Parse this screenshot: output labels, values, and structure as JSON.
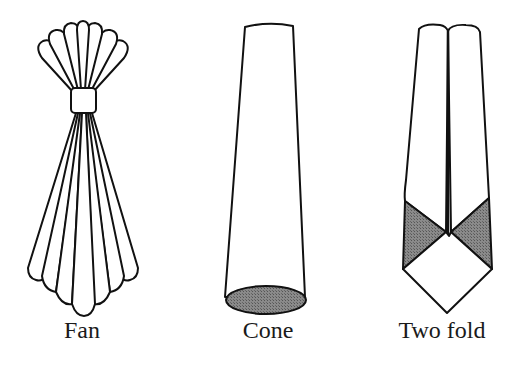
{
  "figure": {
    "items": [
      {
        "id": "fan",
        "label": "Fan",
        "center_x": 82
      },
      {
        "id": "cone",
        "label": "Cone",
        "center_x": 268
      },
      {
        "id": "two-fold",
        "label": "Two fold",
        "center_x": 448
      }
    ],
    "colors": {
      "stroke": "#111111",
      "fill": "#ffffff",
      "shade": "#7a7a7a",
      "background": "#ffffff"
    }
  }
}
